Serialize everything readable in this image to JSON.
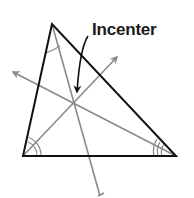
{
  "diagram": {
    "title_label": "Incenter",
    "colors": {
      "triangle": "#111111",
      "bisector": "#8a8a8a",
      "label": "#1a1a1a",
      "pointer": "#111111"
    },
    "triangle": {
      "vertices": {
        "top": [
          52,
          24
        ],
        "bottom_left": [
          23,
          156
        ],
        "bottom_right": [
          176,
          156
        ]
      }
    },
    "incenter": [
      73,
      101
    ],
    "bisectors": [
      {
        "from": "top",
        "to_label": "extends below base"
      },
      {
        "from": "bottom_left",
        "to_label": "arrow upper-right"
      },
      {
        "from": "bottom_right",
        "to_label": "arrow upper-left"
      }
    ],
    "angle_marks": {
      "top": 1,
      "bottom_left": 2,
      "bottom_right": 3
    }
  }
}
